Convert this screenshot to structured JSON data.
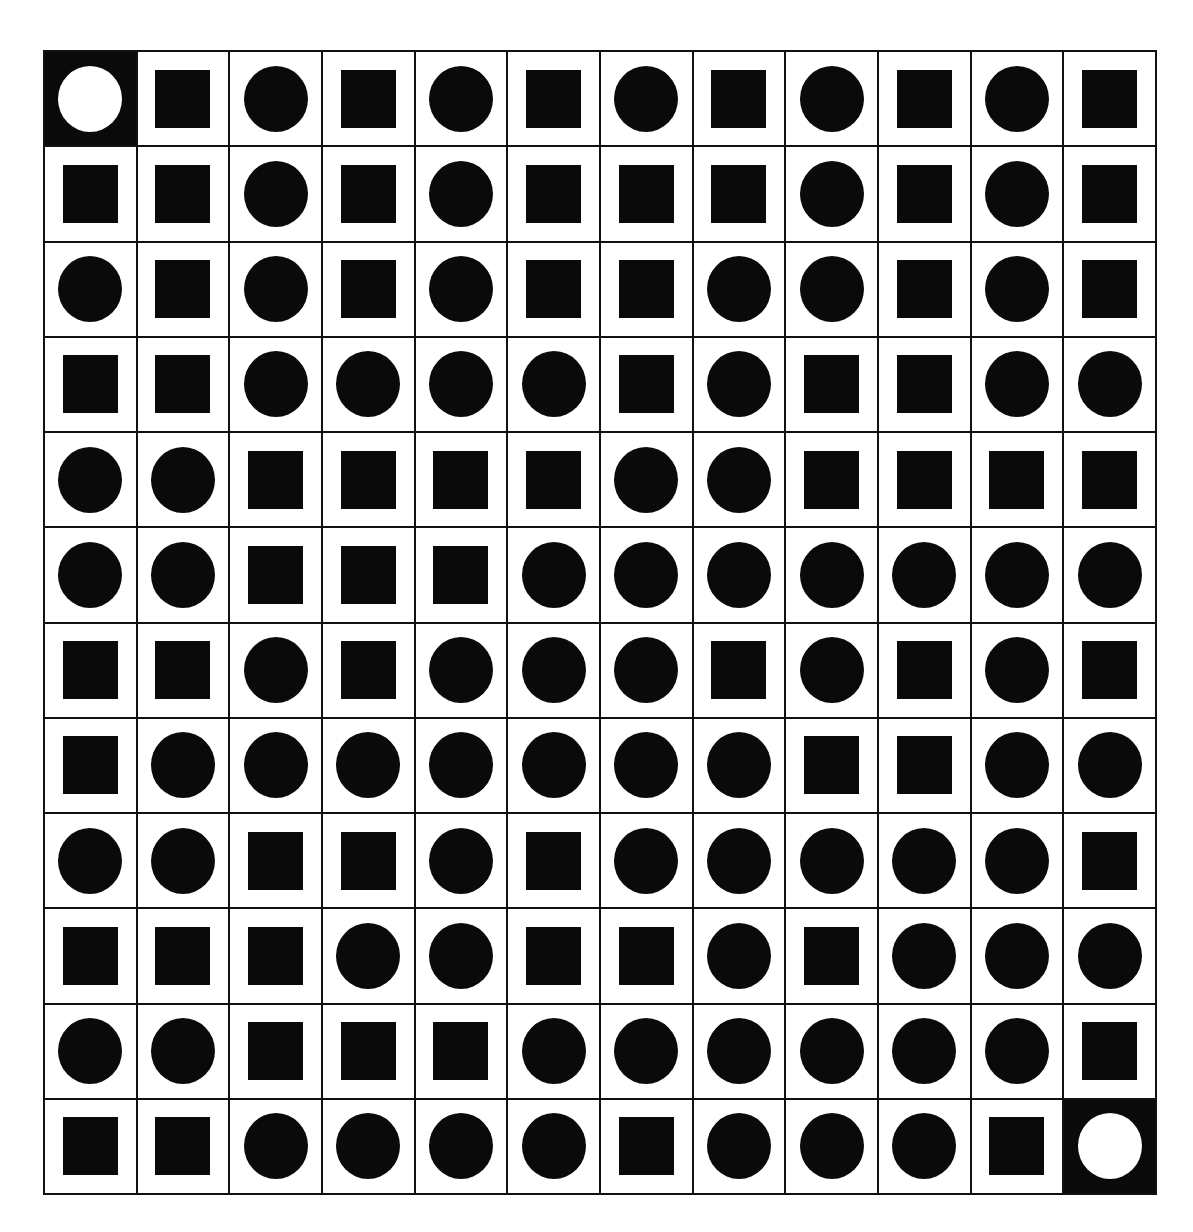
{
  "puzzle": {
    "rows": 12,
    "cols": 12,
    "legend": {
      "C": "black-circle",
      "S": "black-square",
      "O": "white-circle-on-black (start/end marker)"
    },
    "start": {
      "row": 0,
      "col": 0
    },
    "end": {
      "row": 11,
      "col": 11
    },
    "grid": [
      [
        "O",
        "S",
        "C",
        "S",
        "C",
        "S",
        "C",
        "S",
        "C",
        "S",
        "C",
        "S"
      ],
      [
        "S",
        "S",
        "C",
        "S",
        "C",
        "S",
        "S",
        "S",
        "C",
        "S",
        "C",
        "S"
      ],
      [
        "C",
        "S",
        "C",
        "S",
        "C",
        "S",
        "S",
        "C",
        "C",
        "S",
        "C",
        "S"
      ],
      [
        "S",
        "S",
        "C",
        "C",
        "C",
        "C",
        "S",
        "C",
        "S",
        "S",
        "C",
        "C"
      ],
      [
        "C",
        "C",
        "S",
        "S",
        "S",
        "S",
        "C",
        "C",
        "S",
        "S",
        "S",
        "S"
      ],
      [
        "C",
        "C",
        "S",
        "S",
        "S",
        "C",
        "C",
        "C",
        "C",
        "C",
        "C",
        "C"
      ],
      [
        "S",
        "S",
        "C",
        "S",
        "C",
        "C",
        "C",
        "S",
        "C",
        "S",
        "C",
        "S"
      ],
      [
        "S",
        "C",
        "C",
        "C",
        "C",
        "C",
        "C",
        "C",
        "S",
        "S",
        "C",
        "C"
      ],
      [
        "C",
        "C",
        "S",
        "S",
        "C",
        "S",
        "C",
        "C",
        "C",
        "C",
        "C",
        "S"
      ],
      [
        "S",
        "S",
        "S",
        "C",
        "C",
        "S",
        "S",
        "C",
        "S",
        "C",
        "C",
        "C"
      ],
      [
        "C",
        "C",
        "S",
        "S",
        "S",
        "C",
        "C",
        "C",
        "C",
        "C",
        "C",
        "S"
      ],
      [
        "S",
        "S",
        "C",
        "C",
        "C",
        "C",
        "S",
        "C",
        "C",
        "C",
        "S",
        "O"
      ]
    ]
  },
  "colors": {
    "fill": "#0a0a0a",
    "background": "#ffffff",
    "grid_line": "#111111"
  }
}
